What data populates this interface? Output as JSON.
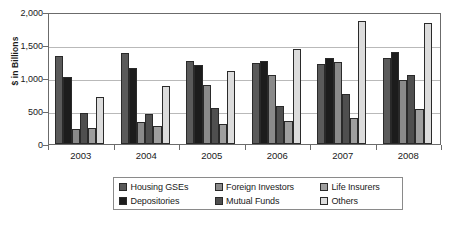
{
  "chart_data": {
    "type": "bar",
    "title": "",
    "xlabel": "",
    "ylabel": "$ in Billions",
    "ylim": [
      0,
      2000
    ],
    "yticks": [
      "0",
      "500",
      "1,000",
      "1,500",
      "2,000"
    ],
    "ytick_values": [
      0,
      500,
      1000,
      1500,
      2000
    ],
    "grid": true,
    "legend_position": "bottom",
    "categories": [
      "2003",
      "2004",
      "2005",
      "2006",
      "2007",
      "2008"
    ],
    "series": [
      {
        "name": "Housing GSEs",
        "color": "#5a5a5a",
        "values": [
          1330,
          1375,
          1265,
          1230,
          1210,
          1310
        ]
      },
      {
        "name": "Depositories",
        "color": "#1c1c1c",
        "values": [
          1010,
          1155,
          1190,
          1255,
          1305,
          1390
        ]
      },
      {
        "name": "Foreign Investors",
        "color": "#8a8a8a",
        "values": [
          230,
          335,
          900,
          1050,
          1250,
          975
        ]
      },
      {
        "name": "Mutual Funds",
        "color": "#4f4f4f",
        "values": [
          470,
          460,
          545,
          580,
          760,
          1040
        ]
      },
      {
        "name": "Life Insurers",
        "color": "#9e9e9e",
        "values": [
          250,
          280,
          300,
          345,
          395,
          525
        ]
      },
      {
        "name": "Others",
        "color": "#dcdcdc",
        "values": [
          710,
          880,
          1110,
          1445,
          1870,
          1830
        ]
      }
    ]
  },
  "legend": {
    "rows": [
      [
        {
          "label": "Housing GSEs",
          "color": "#5a5a5a"
        },
        {
          "label": "Foreign Investors",
          "color": "#8a8a8a"
        },
        {
          "label": "Life Insurers",
          "color": "#9e9e9e"
        }
      ],
      [
        {
          "label": "Depositories",
          "color": "#1c1c1c"
        },
        {
          "label": "Mutual Funds",
          "color": "#4f4f4f"
        },
        {
          "label": "Others",
          "color": "#dcdcdc"
        }
      ]
    ]
  }
}
